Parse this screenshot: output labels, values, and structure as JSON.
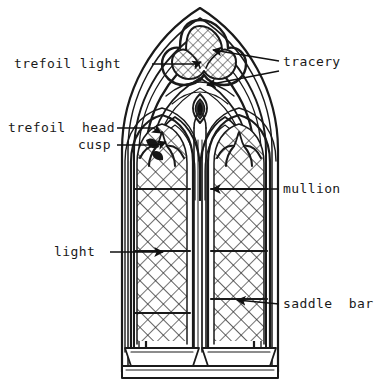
{
  "figure": {
    "kind": "labelled-line-drawing",
    "background_color": "#ffffff",
    "ink_color": "#1a1a1a"
  },
  "labels": [
    {
      "id": "trefoil-light",
      "text": "trefoil light",
      "text_x": 14,
      "text_y": 68,
      "anchor": "start",
      "leaders": [
        {
          "points": "152,64 196,64 200,62",
          "arrow": true,
          "tip_x": 201,
          "tip_y": 62,
          "tip_angle": 200
        }
      ]
    },
    {
      "id": "tracery",
      "text": "tracery",
      "text_x": 283,
      "text_y": 66,
      "anchor": "start",
      "leaders": [
        {
          "points": "278,62 212,50",
          "arrow": true,
          "tip_x": 209,
          "tip_y": 50,
          "tip_angle": 190
        },
        {
          "points": "278,70 207,84",
          "arrow": true,
          "tip_x": 203,
          "tip_y": 85,
          "tip_angle": 168
        }
      ]
    },
    {
      "id": "trefoil-head",
      "text": "trefoil  head",
      "text_x": 8,
      "text_y": 132,
      "anchor": "start",
      "leaders": [
        {
          "points": "117,128 155,128 160,131",
          "arrow": true,
          "tip_x": 161,
          "tip_y": 132,
          "tip_angle": 205
        }
      ]
    },
    {
      "id": "cusp",
      "text": "cusp",
      "text_x": 78,
      "text_y": 149,
      "anchor": "start",
      "leaders": [
        {
          "points": "117,145 160,145 165,142",
          "arrow": true,
          "tip_x": 166,
          "tip_y": 141,
          "tip_angle": 200
        }
      ]
    },
    {
      "id": "mullion",
      "text": "mullion",
      "text_x": 283,
      "text_y": 193,
      "anchor": "start",
      "leaders": [
        {
          "points": "278,189 215,189",
          "arrow": true,
          "tip_x": 211,
          "tip_y": 189,
          "tip_angle": 180
        }
      ]
    },
    {
      "id": "light",
      "text": "light",
      "text_x": 54,
      "text_y": 256,
      "anchor": "start",
      "leaders": [
        {
          "points": "110,252 160,252",
          "arrow": true,
          "tip_x": 164,
          "tip_y": 252,
          "tip_angle": 0
        }
      ]
    },
    {
      "id": "saddle-bar",
      "text": "saddle  bar",
      "text_x": 283,
      "text_y": 308,
      "anchor": "start",
      "leaders": [
        {
          "points": "278,304 238,300",
          "arrow": true,
          "tip_x": 234,
          "tip_y": 299,
          "tip_angle": 186
        }
      ]
    }
  ],
  "window": {
    "parts": [
      "outer hood arch",
      "tracery head",
      "trefoil light",
      "vesica ornament",
      "left lancet light",
      "right lancet light",
      "mullion",
      "cusped lancet heads",
      "saddle bars",
      "diamond quarry glazing",
      "sill"
    ],
    "lancet_count": 2,
    "saddle_bar_count_per_light": 3,
    "glazing_pattern": "diagonal diamond quarries"
  }
}
